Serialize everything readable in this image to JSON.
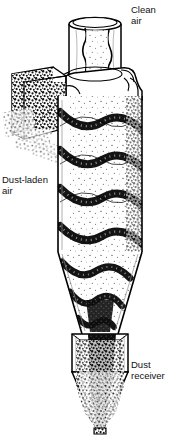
{
  "figure": {
    "type": "technical-line-drawing",
    "background_color": "#ffffff",
    "line_color": "#000000",
    "stipple_color": "#1a1a1a",
    "width": 189,
    "height": 437
  },
  "labels": {
    "clean_air": {
      "line1": "Clean",
      "line2": "air"
    },
    "dust_laden_air": {
      "line1": "Dust-laden",
      "line2": "air"
    },
    "dust_receiver": {
      "line1": "Dust",
      "line2": "receiver"
    }
  },
  "components": {
    "outlet_pipe": "clean-air outlet pipe (vortex finder)",
    "inlet_duct": "tangential dust-laden air inlet duct",
    "cylinder_body": "cyclone cylindrical body",
    "cone_section": "cyclone conical section",
    "receiver_box": "dust receiver upper box",
    "receiver_funnel": "dust receiver conical funnel",
    "helical_flow": "descending helical dust vortex",
    "core_flow": "ascending central core of fine dust"
  },
  "flow": {
    "helix_turns": 4,
    "direction": "downward spiral along wall, upward through core"
  }
}
